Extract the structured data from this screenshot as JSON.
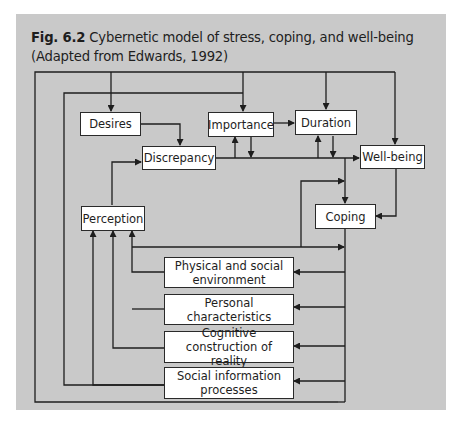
{
  "figure": {
    "label": "Fig. 6.2",
    "caption": "Cybernetic model of stress, coping, and well-being (Adapted from Edwards, 1992)"
  },
  "nodes": {
    "desires": "Desires",
    "importance": "Importance",
    "duration": "Duration",
    "discrepancy": "Discrepancy",
    "well_being": "Well-being",
    "perception": "Perception",
    "coping": "Coping",
    "physical_env": "Physical and social environment",
    "personal_char": "Personal characteristics",
    "cognitive": "Cognitive construction of reality",
    "social_info": "Social information processes"
  },
  "edges": [
    {
      "from": "outer-loop",
      "to": "Desires"
    },
    {
      "from": "outer-loop",
      "to": "Duration"
    },
    {
      "from": "outer-loop",
      "to": "Well-being"
    },
    {
      "from": "inner-loop",
      "to": "Importance"
    },
    {
      "from": "Desires",
      "to": "Discrepancy"
    },
    {
      "from": "Importance",
      "to": "Duration"
    },
    {
      "from": "Perception",
      "to": "Discrepancy"
    },
    {
      "from": "Discrepancy",
      "to": "Well-being"
    },
    {
      "from": "Discrepancy",
      "to": "Importance"
    },
    {
      "from": "Importance",
      "to": "Discrepancy-line"
    },
    {
      "from": "Discrepancy",
      "to": "Duration"
    },
    {
      "from": "Duration",
      "to": "Discrepancy-line"
    },
    {
      "from": "Discrepancy",
      "to": "Coping"
    },
    {
      "from": "Well-being",
      "to": "Coping"
    },
    {
      "from": "Physical and social environment",
      "to": "Coping"
    },
    {
      "from": "Coping",
      "to": "Physical and social environment"
    },
    {
      "from": "Coping",
      "to": "Personal characteristics"
    },
    {
      "from": "Coping",
      "to": "Cognitive construction of reality"
    },
    {
      "from": "Coping",
      "to": "Social information processes"
    },
    {
      "from": "Physical and social environment",
      "to": "Perception"
    },
    {
      "from": "Personal characteristics",
      "to": "Perception"
    },
    {
      "from": "Cognitive construction of reality",
      "to": "Perception"
    },
    {
      "from": "Social information processes",
      "to": "Perception"
    }
  ]
}
